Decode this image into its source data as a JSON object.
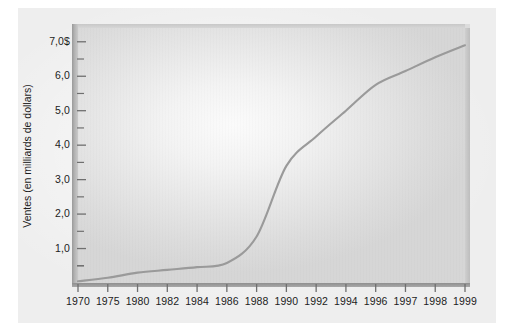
{
  "chart_data": {
    "type": "line",
    "title": "",
    "xlabel": "",
    "ylabel": "Ventes (en milliards de dollars)",
    "categories": [
      "1970",
      "1975",
      "1980",
      "1982",
      "1984",
      "1986",
      "1988",
      "1990",
      "1992",
      "1994",
      "1996",
      "1997",
      "1998",
      "1999"
    ],
    "values": [
      0.05,
      0.15,
      0.3,
      0.38,
      0.46,
      0.58,
      1.35,
      3.4,
      4.25,
      5.0,
      5.75,
      6.15,
      6.55,
      6.9
    ],
    "series": [
      {
        "name": "Ventes",
        "values": [
          0.05,
          0.15,
          0.3,
          0.38,
          0.46,
          0.58,
          1.35,
          3.4,
          4.25,
          5.0,
          5.75,
          6.15,
          6.55,
          6.9
        ]
      }
    ],
    "ylim": [
      0,
      7.4
    ],
    "y_major_ticks": [
      1.0,
      2.0,
      3.0,
      4.0,
      5.0,
      6.0,
      7.0
    ],
    "y_minor_ticks": [
      0.5,
      1.5,
      2.5,
      3.5,
      4.5,
      5.5,
      6.5,
      7.0
    ],
    "y_tick_labels": [
      "1,0",
      "2,0",
      "3,0",
      "4,0",
      "5,0",
      "6,0",
      "7,0$"
    ],
    "grid": false,
    "legend": null,
    "line_color": "#9a9a9a",
    "plot_background": "#e4e4e4",
    "axis_color": "#6f6f6f"
  },
  "axes": {
    "y_title": "Ventes (en milliards de dollars)",
    "y_ticks": [
      {
        "label": "7,0$",
        "value": 7.0
      },
      {
        "label": "6,0",
        "value": 6.0
      },
      {
        "label": "5,0",
        "value": 5.0
      },
      {
        "label": "4,0",
        "value": 4.0
      },
      {
        "label": "3,0",
        "value": 3.0
      },
      {
        "label": "2,0",
        "value": 2.0
      },
      {
        "label": "1,0",
        "value": 1.0
      }
    ],
    "x_ticks": [
      {
        "label": "1970"
      },
      {
        "label": "1975"
      },
      {
        "label": "1980"
      },
      {
        "label": "1982"
      },
      {
        "label": "1984"
      },
      {
        "label": "1986"
      },
      {
        "label": "1988"
      },
      {
        "label": "1990"
      },
      {
        "label": "1992"
      },
      {
        "label": "1994"
      },
      {
        "label": "1996"
      },
      {
        "label": "1997"
      },
      {
        "label": "1998"
      },
      {
        "label": "1999"
      }
    ]
  }
}
